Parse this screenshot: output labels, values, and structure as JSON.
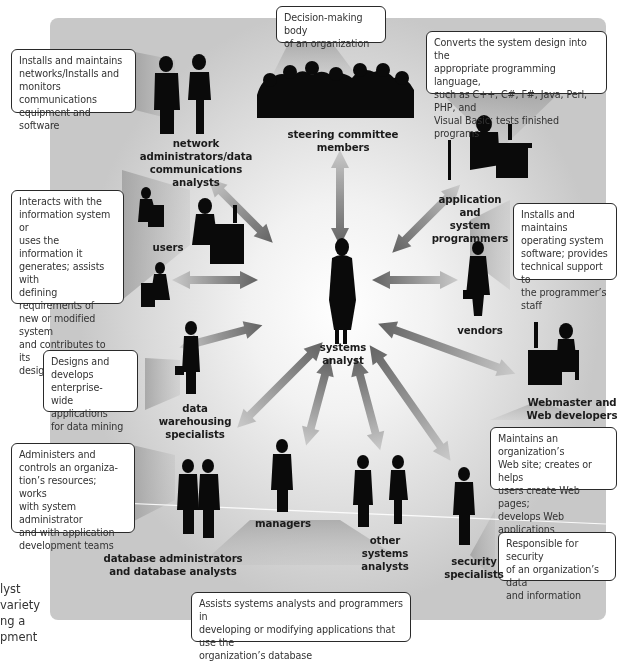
{
  "diagram": {
    "center": {
      "label": "systems analyst",
      "label_lines": [
        "systems",
        "analyst"
      ]
    },
    "roles": [
      {
        "id": "steering",
        "label_lines": [
          "steering committee members"
        ],
        "description": "Decision-making body of an organization",
        "desc_lines": [
          "Decision-making body",
          "of an organization"
        ]
      },
      {
        "id": "network",
        "label_lines": [
          "network administrators/data",
          "communications",
          "analysts"
        ],
        "description": "Installs and maintains networks/Installs and monitors communications equipment and software",
        "desc_lines": [
          "Installs and maintains",
          "networks/Installs and",
          "monitors communications",
          "equipment and software"
        ]
      },
      {
        "id": "programmers",
        "label_lines": [
          "application and",
          "system",
          "programmers"
        ],
        "description": "Converts the system design into the appropriate programming language, such as C++, C#, F#, Java, Perl, PHP, and Visual Basic; tests finished programs",
        "desc_lines": [
          "Converts the system design into the",
          "appropriate programming language,",
          "such as C++, C#, F#, Java, Perl, PHP, and",
          "Visual Basic; tests finished programs"
        ]
      },
      {
        "id": "system_programmers_note",
        "description": "Installs and maintains operating system software; provides technical support to the programmer's staff",
        "desc_lines": [
          "Installs and maintains",
          "operating system",
          "software; provides",
          "technical support to",
          "the programmer’s staff"
        ]
      },
      {
        "id": "users",
        "label_lines": [
          "users"
        ],
        "description": "Interacts with the information system or uses the information it generates; assists with defining requirements of new or modified system and contributes to its design",
        "desc_lines": [
          "Interacts with the",
          "information system or",
          "uses the information it",
          "generates; assists with",
          "defining requirements of",
          "new or modified system",
          "and contributes to its",
          "design"
        ]
      },
      {
        "id": "vendors",
        "label_lines": [
          "vendors"
        ]
      },
      {
        "id": "data_warehousing",
        "label_lines": [
          "data",
          "warehousing",
          "specialists"
        ],
        "description": "Designs and develops enterprise-wide applications for data mining",
        "desc_lines": [
          "Designs and",
          "develops enterprise-",
          "wide applications",
          "for data mining"
        ]
      },
      {
        "id": "webmaster",
        "label_lines": [
          "Webmaster and",
          "Web developers"
        ],
        "description": "Maintains an organization's Web site; creates or helps users create Web pages; develops Web applications",
        "desc_lines": [
          "Maintains an organization’s",
          "Web site; creates or helps",
          "users create Web pages;",
          "develops Web applications"
        ]
      },
      {
        "id": "dba",
        "label_lines": [
          "database administrators",
          "and database analysts"
        ],
        "description": "Administers and controls an organization's resources; works with system administrator and with application development teams",
        "desc_lines": [
          "Administers and",
          "controls an organiza-",
          "tion’s resources; works",
          "with system administrator",
          "and with application",
          "development teams"
        ]
      },
      {
        "id": "managers",
        "label_lines": [
          "managers"
        ]
      },
      {
        "id": "other_analysts",
        "label_lines": [
          "other",
          "systems analysts"
        ]
      },
      {
        "id": "security",
        "label_lines": [
          "security",
          "specialists"
        ],
        "description": "Responsible for security of an organization's data and information",
        "desc_lines": [
          "Responsible for security",
          "of an organization’s data",
          "and information"
        ]
      },
      {
        "id": "db_analysts_note",
        "description": "Assists systems analysts and programmers in developing or modifying applications that use the organization's database",
        "desc_lines": [
          "Assists systems analysts and programmers in",
          "developing or modifying applications that use the",
          "organization’s database"
        ]
      }
    ]
  },
  "side_caption": {
    "lines": [
      "lyst",
      "variety",
      "ng a",
      "pment"
    ]
  },
  "colors": {
    "panel": "#d4d4d4",
    "silhouette": "#0a0a0a",
    "callout_border": "#2a2a2a",
    "arrow": "#7a7a7a"
  }
}
